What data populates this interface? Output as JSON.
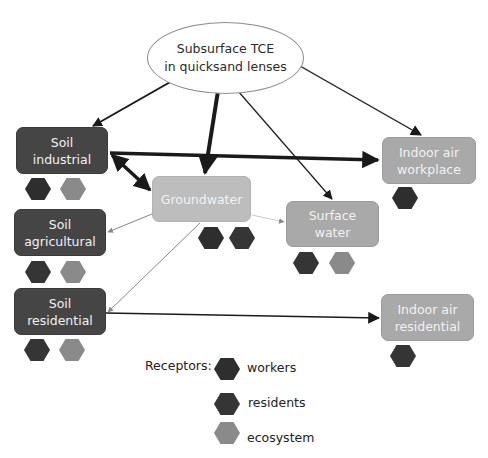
{
  "source": {
    "label": "Subsurface TCE\nin quicksand lenses"
  },
  "nodes": {
    "soil_industrial": {
      "label": "Soil\nindustrial"
    },
    "soil_agricultural": {
      "label": "Soil\nagricultural"
    },
    "soil_residential": {
      "label": "Soil\nresidential"
    },
    "groundwater": {
      "label": "Groundwater"
    },
    "surface_water": {
      "label": "Surface\nwater"
    },
    "indoor_air_workplace": {
      "label": "Indoor air\nworkplace"
    },
    "indoor_air_residential": {
      "label": "Indoor air\nresidential"
    }
  },
  "receptor_colors": {
    "workers": "#2e2e2e",
    "residents": "#353535",
    "ecosystem": "#8a8a8a"
  },
  "node_receptors": {
    "soil_industrial": [
      "workers",
      "ecosystem"
    ],
    "soil_agricultural": [
      "residents",
      "ecosystem"
    ],
    "soil_residential": [
      "residents",
      "ecosystem"
    ],
    "groundwater": [
      "workers",
      "residents"
    ],
    "surface_water": [
      "residents",
      "ecosystem"
    ],
    "indoor_air_workplace": [
      "workers"
    ],
    "indoor_air_residential": [
      "residents"
    ]
  },
  "edges": [
    {
      "from": "source",
      "to": "soil_industrial",
      "weight": "medium"
    },
    {
      "from": "source",
      "to": "groundwater",
      "weight": "heavy"
    },
    {
      "from": "source",
      "to": "surface_water",
      "weight": "thin"
    },
    {
      "from": "source",
      "to": "indoor_air_workplace",
      "weight": "thin"
    },
    {
      "from": "soil_industrial",
      "to": "indoor_air_workplace",
      "weight": "heavy"
    },
    {
      "from": "soil_industrial",
      "to": "groundwater",
      "weight": "heavy",
      "bidirectional": true
    },
    {
      "from": "groundwater",
      "to": "soil_agricultural",
      "weight": "hairline"
    },
    {
      "from": "groundwater",
      "to": "surface_water",
      "weight": "hairline"
    },
    {
      "from": "groundwater",
      "to": "soil_residential",
      "weight": "hairline"
    },
    {
      "from": "soil_residential",
      "to": "indoor_air_residential",
      "weight": "thin"
    }
  ],
  "legend": {
    "title": "Receptors:",
    "items": [
      {
        "label": "workers",
        "color": "#2e2e2e"
      },
      {
        "label": "residents",
        "color": "#353535"
      },
      {
        "label": "ecosystem",
        "color": "#8a8a8a"
      }
    ]
  }
}
